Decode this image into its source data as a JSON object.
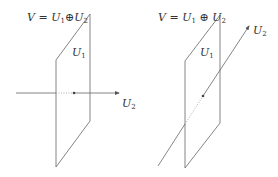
{
  "left_figure": {
    "formula": {
      "lhs": "V",
      "eq": " = ",
      "u1": "U",
      "u1_sub": "1",
      "op": "⊕",
      "u2": "U",
      "u2_sub": "2"
    },
    "plane_label": {
      "base": "U",
      "sub": "1"
    },
    "line_label": {
      "base": "U",
      "sub": "2"
    }
  },
  "right_figure": {
    "formula": {
      "lhs": "V",
      "eq": " = ",
      "u1": "U",
      "u1_sub": "1",
      "op": " ⊕ ",
      "u2": "U",
      "u2_sub": "2"
    },
    "plane_label": {
      "base": "U",
      "sub": "1"
    },
    "line_label": {
      "base": "U",
      "sub": "2"
    }
  },
  "colors": {
    "stroke": "#555555",
    "text": "#333333"
  }
}
